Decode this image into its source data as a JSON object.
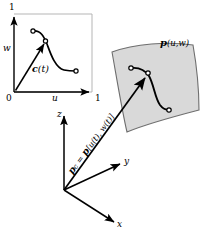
{
  "figure": {
    "type": "geometric-modeling-diagram",
    "colors": {
      "ink": "#000000",
      "surface_fill": "#d9d9d9",
      "surface_edge": "#6e6e6e",
      "square_border": "#b5b5b5",
      "background": "#ffffff"
    }
  },
  "parameter_square": {
    "name": "unit parameter domain",
    "origin_label": "0",
    "w_axis": {
      "variable": "w",
      "max_tick": "1"
    },
    "u_axis": {
      "variable": "u",
      "max_tick": "1"
    },
    "curve": {
      "label": "c(t)",
      "label_symbol": "c",
      "label_arg": "(t)",
      "start_point": "open-circle",
      "end_point": "open-circle",
      "mid_point": "open-circle"
    }
  },
  "surface_patch": {
    "label_symbol": "p",
    "label_arg": "(u,w)",
    "label_full": "p(u,w)",
    "curve": {
      "start_point": "open-circle",
      "end_point": "open-circle",
      "mid_point": "open-circle"
    }
  },
  "coordinate_frame": {
    "axes": [
      {
        "id": "z",
        "label": "z",
        "direction": "up"
      },
      {
        "id": "y",
        "label": "y",
        "direction": "right"
      },
      {
        "id": "x",
        "label": "x",
        "direction": "down-right"
      }
    ]
  },
  "position_vector": {
    "symbol": "p",
    "subscript": "c",
    "equals": "=",
    "expression_symbol": "p",
    "expression_arg": "[u(t), w(t)]",
    "full_text": "p_c = p[u(t), w(t)]"
  }
}
